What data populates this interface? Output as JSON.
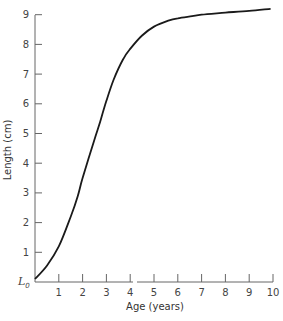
{
  "chart_data": {
    "type": "line",
    "title": "",
    "xlabel": "Age (years)",
    "ylabel": "Length (cm)",
    "x_ticks": [
      "1",
      "2",
      "3",
      "4",
      "5",
      "6",
      "7",
      "8",
      "9",
      "10"
    ],
    "y_ticks": [
      "1",
      "2",
      "3",
      "4",
      "5",
      "6",
      "7",
      "8",
      "9"
    ],
    "y_origin_label": "L",
    "y_origin_subscript": "0",
    "xlim": [
      0,
      10
    ],
    "ylim": [
      0,
      9
    ],
    "grid": false,
    "legend": null,
    "x_axis_break_between": [
      4,
      5
    ],
    "series": [
      {
        "name": "Growth curve",
        "x": [
          0,
          0.5,
          1,
          1.5,
          1.8,
          2,
          2.5,
          2.7,
          3,
          3.3,
          3.7,
          4,
          4.5,
          5,
          5.6,
          6,
          6.6,
          7,
          8,
          9,
          9.9
        ],
        "y": [
          0.1,
          0.55,
          1.2,
          2.2,
          2.9,
          3.5,
          4.8,
          5.3,
          6.1,
          6.8,
          7.5,
          7.85,
          8.3,
          8.6,
          8.8,
          8.88,
          8.95,
          9.0,
          9.07,
          9.13,
          9.2
        ]
      }
    ]
  }
}
